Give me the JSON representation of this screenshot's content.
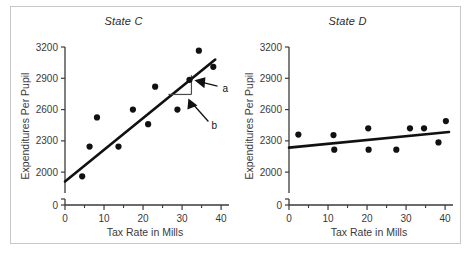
{
  "figure": {
    "frame_color": "#c8c8c8",
    "background": "#ffffff"
  },
  "chart_data": [
    {
      "type": "scatter",
      "title": "State C",
      "xlabel": "Tax Rate in Mills",
      "ylabel": "Expenditures Per Pupil",
      "xlim": [
        0,
        41
      ],
      "ylim": [
        1800,
        3200
      ],
      "xticks": [
        0,
        10,
        20,
        30,
        40
      ],
      "xtick_labels": [
        "0",
        "10",
        "20",
        "30",
        "40"
      ],
      "xminor_ticks": [
        5,
        15,
        25,
        35
      ],
      "yticks": [
        2000,
        2300,
        2600,
        2900,
        3200
      ],
      "ytick_labels": [
        "2000",
        "2300",
        "2600",
        "2900",
        "3200"
      ],
      "y_origin_label": "0",
      "y_axis_broken": true,
      "grid": false,
      "legend": "none",
      "marker_color": "#111111",
      "line_color": "#111111",
      "points": [
        {
          "x": 4.4,
          "y": 1960
        },
        {
          "x": 6.3,
          "y": 2245
        },
        {
          "x": 8.2,
          "y": 2525
        },
        {
          "x": 13.7,
          "y": 2245
        },
        {
          "x": 17.4,
          "y": 2600
        },
        {
          "x": 21.3,
          "y": 2460
        },
        {
          "x": 23.1,
          "y": 2820
        },
        {
          "x": 28.8,
          "y": 2600
        },
        {
          "x": 31.9,
          "y": 2885
        },
        {
          "x": 34.3,
          "y": 3165
        },
        {
          "x": 38.0,
          "y": 3010
        }
      ],
      "trend_line": {
        "x0": 0,
        "y0": 1910,
        "x1": 38.5,
        "y1": 3080
      },
      "annotations": [
        {
          "label": "a",
          "description": "rise of slope triangle"
        },
        {
          "label": "b",
          "description": "run of slope triangle"
        }
      ],
      "slope_triangle": {
        "x_left": 26.5,
        "x_right": 32.4,
        "y_low": 2745,
        "y_high": 2930
      }
    },
    {
      "type": "scatter",
      "title": "State D",
      "xlabel": "Tax Rate in Mills",
      "ylabel": "Expenditures Per Pupil",
      "xlim": [
        0,
        41
      ],
      "ylim": [
        1800,
        3200
      ],
      "xticks": [
        0,
        10,
        20,
        30,
        40
      ],
      "xtick_labels": [
        "0",
        "10",
        "20",
        "30",
        "40"
      ],
      "xminor_ticks": [
        5,
        15,
        25,
        35
      ],
      "yticks": [
        2000,
        2300,
        2600,
        2900,
        3200
      ],
      "ytick_labels": [
        "2000",
        "2300",
        "2600",
        "2900",
        "3200"
      ],
      "y_origin_label": "0",
      "y_axis_broken": true,
      "grid": false,
      "legend": "none",
      "marker_color": "#111111",
      "line_color": "#111111",
      "points": [
        {
          "x": 2.4,
          "y": 2360
        },
        {
          "x": 11.4,
          "y": 2355
        },
        {
          "x": 11.6,
          "y": 2215
        },
        {
          "x": 20.3,
          "y": 2420
        },
        {
          "x": 20.4,
          "y": 2215
        },
        {
          "x": 27.5,
          "y": 2215
        },
        {
          "x": 31.0,
          "y": 2420
        },
        {
          "x": 34.6,
          "y": 2420
        },
        {
          "x": 38.3,
          "y": 2285
        },
        {
          "x": 40.2,
          "y": 2490
        }
      ],
      "trend_line": {
        "x0": 0,
        "y0": 2235,
        "x1": 41.0,
        "y1": 2385
      }
    }
  ]
}
